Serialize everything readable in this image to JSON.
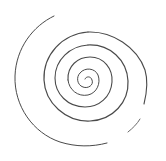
{
  "image": {
    "description": "Hand-drawn spiral sketch on white background",
    "background_color": "#ffffff",
    "stroke_color": "#4a4a4a",
    "center": [
      88,
      80
    ]
  }
}
